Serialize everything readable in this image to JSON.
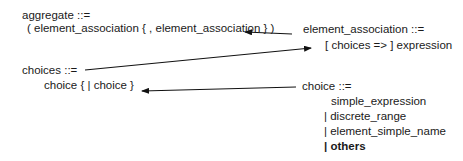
{
  "rules": {
    "aggregate": {
      "head": "aggregate ::=",
      "body": "( element_association { , element_association } )"
    },
    "element_association": {
      "head": "element_association ::=",
      "body": "[ choices => ] expression"
    },
    "choices": {
      "head": "choices ::=",
      "body": "choice { | choice }"
    },
    "choice": {
      "head": "choice ::=",
      "alternatives": [
        "simple_expression",
        "| discrete_range",
        "| element_simple_name",
        "| others"
      ]
    }
  },
  "arrows": [
    {
      "from": "element_association",
      "to": "aggregate"
    },
    {
      "from": "choices",
      "to": "element_association"
    },
    {
      "from": "choice",
      "to": "choices"
    }
  ],
  "colors": {
    "text": "#1a1a1a",
    "arrow": "#111111",
    "background": "#ffffff"
  }
}
